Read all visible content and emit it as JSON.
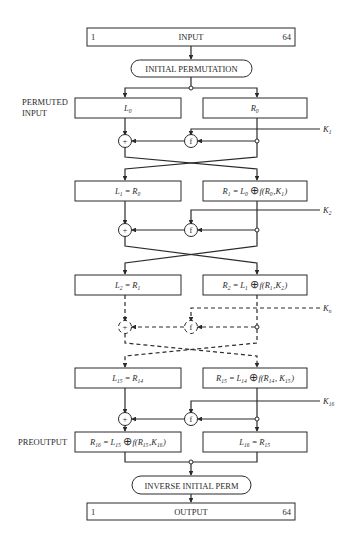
{
  "diagram": {
    "input": {
      "label": "INPUT",
      "bit_start": "1",
      "bit_end": "64"
    },
    "initial_permutation": {
      "label": "INITIAL PERMUTATION"
    },
    "permuted_input_label": [
      "PERMUTED",
      "INPUT"
    ],
    "rounds": [
      {
        "left": {
          "text": "L",
          "sub": "0"
        },
        "right": {
          "text": "R",
          "sub": "0"
        },
        "key": {
          "text": "K",
          "sub": "1"
        },
        "style": "solid"
      },
      {
        "left": {
          "parts": [
            {
              "t": "L",
              "s": "1"
            },
            {
              "t": " = "
            },
            {
              "t": "R",
              "s": "0"
            }
          ]
        },
        "right": {
          "parts": [
            {
              "t": "R",
              "s": "1"
            },
            {
              "t": " = "
            },
            {
              "t": "L",
              "s": "0"
            },
            {
              "xor": true
            },
            {
              "t": "f(R"
            },
            {
              "t": "",
              "s": "0"
            },
            {
              "t": ",K"
            },
            {
              "t": "",
              "s": "1"
            },
            {
              "t": ")"
            }
          ]
        },
        "key": {
          "text": "K",
          "sub": "2"
        },
        "style": "solid"
      },
      {
        "left": {
          "parts": [
            {
              "t": "L",
              "s": "2"
            },
            {
              "t": " = "
            },
            {
              "t": "R",
              "s": "1"
            }
          ]
        },
        "right": {
          "parts": [
            {
              "t": "R",
              "s": "2"
            },
            {
              "t": " = "
            },
            {
              "t": "L",
              "s": "1"
            },
            {
              "xor": true
            },
            {
              "t": "f(R"
            },
            {
              "t": "",
              "s": "1"
            },
            {
              "t": ",K"
            },
            {
              "t": "",
              "s": "2"
            },
            {
              "t": ")"
            }
          ]
        },
        "key": {
          "text": "K",
          "sub": "n"
        },
        "style": "dashed"
      },
      {
        "left": {
          "parts": [
            {
              "t": "L",
              "s": "15"
            },
            {
              "t": " = "
            },
            {
              "t": "R",
              "s": "14"
            }
          ]
        },
        "right": {
          "parts": [
            {
              "t": "R",
              "s": "15"
            },
            {
              "t": " = "
            },
            {
              "t": "L",
              "s": "14"
            },
            {
              "xor": true
            },
            {
              "t": "f(R"
            },
            {
              "t": "",
              "s": "14"
            },
            {
              "t": ", K"
            },
            {
              "t": "",
              "s": "15"
            },
            {
              "t": ")"
            }
          ]
        },
        "key": {
          "text": "K",
          "sub": "16"
        },
        "style": "solid"
      }
    ],
    "preoutput_label": "PREOUTPUT",
    "final": {
      "left": {
        "parts": [
          {
            "t": "R",
            "s": "16"
          },
          {
            "t": " = "
          },
          {
            "t": "L",
            "s": "15"
          },
          {
            "xor": true
          },
          {
            "t": "f(R"
          },
          {
            "t": "",
            "s": "15"
          },
          {
            "t": ",K"
          },
          {
            "t": "",
            "s": "16"
          },
          {
            "t": ")"
          }
        ]
      },
      "right": {
        "parts": [
          {
            "t": "L",
            "s": "16"
          },
          {
            "t": " = "
          },
          {
            "t": "R",
            "s": "15"
          }
        ]
      }
    },
    "f_label": "f",
    "xor_symbol": "+",
    "inverse_permutation": {
      "label": "INVERSE INITIAL PERM"
    },
    "output": {
      "label": "OUTPUT",
      "bit_start": "1",
      "bit_end": "64"
    },
    "colors": {
      "stroke": "#2a2a2a",
      "background": "#ffffff"
    }
  }
}
